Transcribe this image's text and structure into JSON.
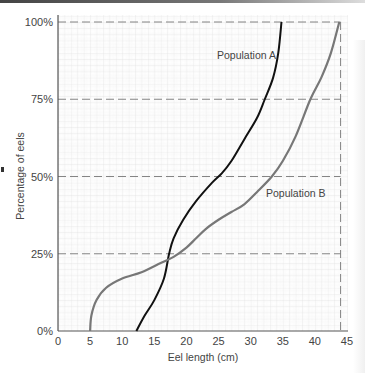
{
  "chart_data": {
    "type": "line",
    "title": "",
    "xlabel": "Eel length (cm)",
    "ylabel": "Percentage of eels",
    "xlim": [
      0,
      45
    ],
    "ylim": [
      0,
      100
    ],
    "x_ticks": [
      "0",
      "5",
      "10",
      "15",
      "20",
      "25",
      "30",
      "35",
      "40",
      "45"
    ],
    "y_ticks": [
      "0%",
      "25%",
      "50%",
      "75%",
      "100%"
    ],
    "grid": true,
    "reference_lines": {
      "horizontal_dashed_pct": [
        25,
        50,
        75,
        100
      ],
      "vertical_dashed_cm": [
        44
      ]
    },
    "series": [
      {
        "name": "Population A",
        "color": "#111111",
        "x": [
          12.2,
          13.5,
          15,
          16.5,
          17.3,
          18,
          19.5,
          21.5,
          24,
          25.5,
          27,
          29,
          31,
          32.2,
          33.5,
          34.3,
          34.8
        ],
        "y": [
          0,
          5,
          10,
          17,
          25,
          30,
          36,
          42,
          48,
          51,
          55,
          62,
          69,
          75,
          82,
          90,
          100
        ]
      },
      {
        "name": "Population B",
        "color": "#777777",
        "x": [
          5,
          5.2,
          6,
          7.5,
          10,
          13,
          16,
          18,
          20,
          21.5,
          23,
          25,
          27,
          29,
          31,
          33.3,
          35,
          37,
          39.3,
          41,
          42.5,
          43.8
        ],
        "y": [
          0,
          5,
          10,
          14,
          17,
          19,
          22,
          24,
          27,
          30,
          33,
          36,
          38.5,
          41,
          45,
          50,
          55,
          63,
          75,
          82,
          90,
          100
        ]
      }
    ],
    "annotations": [
      "Population A",
      "Population B"
    ]
  }
}
